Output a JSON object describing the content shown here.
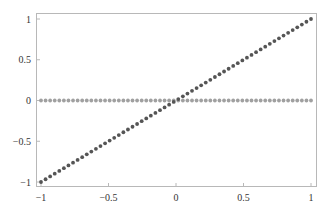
{
  "chart_data": {
    "type": "scatter",
    "title": "",
    "xlabel": "",
    "ylabel": "",
    "xlim": [
      -1,
      1
    ],
    "ylim": [
      -1,
      1
    ],
    "grid": false,
    "legend": null,
    "x_ticks": [
      -1,
      -0.5,
      0,
      0.5,
      1
    ],
    "x_tick_labels": [
      "−1",
      "−0.5",
      "0",
      "0.5",
      "1"
    ],
    "y_ticks": [
      1,
      0.5,
      0,
      -0.5,
      -1
    ],
    "y_tick_labels": [
      "1",
      "0.5",
      "0",
      "−0.5",
      "−1"
    ],
    "series": [
      {
        "name": "y = x",
        "color": "#555555",
        "x_range": [
          -1,
          1
        ],
        "points": 60,
        "slope": 1,
        "intercept": 0
      },
      {
        "name": "y = 0",
        "color": "#a0a0a0",
        "x_range": [
          -1,
          1
        ],
        "points": 60,
        "slope": 0,
        "intercept": 0
      }
    ]
  },
  "colors": {
    "frame": "#b8b8b8",
    "tick_text": "#333333"
  }
}
